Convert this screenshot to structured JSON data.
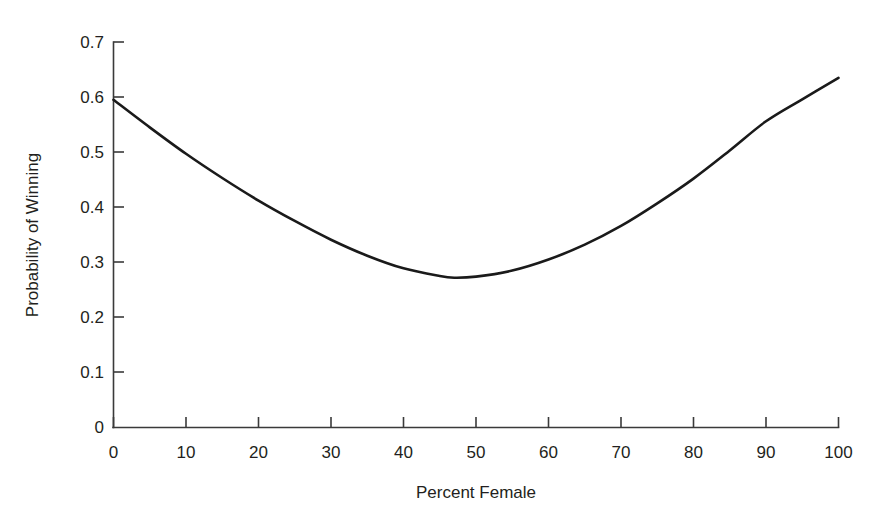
{
  "chart_data": {
    "type": "line",
    "title": "",
    "subtitle": "",
    "xlabel": "Percent Female",
    "ylabel": "Probability of Winning",
    "xlim": [
      0,
      100
    ],
    "ylim": [
      0,
      0.7
    ],
    "grid": false,
    "legend": false,
    "legend_position": "none",
    "xticks": [
      0,
      10,
      20,
      30,
      40,
      50,
      60,
      70,
      80,
      90,
      100
    ],
    "xticklabels": [
      "0",
      "10",
      "20",
      "30",
      "40",
      "50",
      "60",
      "70",
      "80",
      "90",
      "100"
    ],
    "yticks": [
      0,
      0.1,
      0.2,
      0.3,
      0.4,
      0.5,
      0.6,
      0.7
    ],
    "yticklabels": [
      "0",
      "0.1",
      "0.2",
      "0.3",
      "0.4",
      "0.5",
      "0.6",
      "0.7"
    ],
    "series": [
      {
        "name": "Probability of Winning",
        "color": "#1a1a1a",
        "linewidth": 2.6,
        "x": [
          0,
          5,
          10,
          15,
          20,
          25,
          30,
          35,
          40,
          45,
          47,
          50,
          55,
          60,
          65,
          70,
          75,
          80,
          85,
          90,
          95,
          100
        ],
        "y": [
          0.595,
          0.545,
          0.497,
          0.453,
          0.412,
          0.375,
          0.341,
          0.312,
          0.289,
          0.275,
          0.272,
          0.274,
          0.285,
          0.305,
          0.332,
          0.366,
          0.407,
          0.452,
          0.503,
          0.556,
          0.596,
          0.635
        ]
      }
    ],
    "annotations": []
  },
  "axes": {
    "x_axis_label": "Percent Female",
    "y_axis_label": "Probability of Winning",
    "axis_color": "#3a3a3a",
    "curve_color": "#1a1a1a",
    "background_color": "#ffffff"
  }
}
